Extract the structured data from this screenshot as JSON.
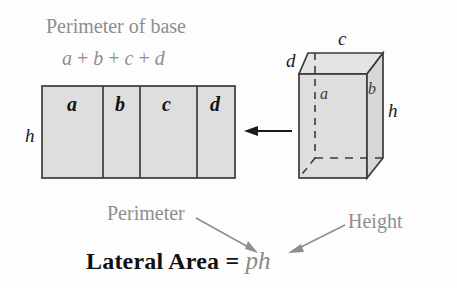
{
  "figure": {
    "title_annotation": "Perimeter of base",
    "base_sum_expression": {
      "terms": [
        "a",
        "b",
        "c",
        "d"
      ],
      "plus": "+",
      "full": "a + b + c + d"
    },
    "net_rectangle": {
      "panel_labels": [
        "a",
        "b",
        "c",
        "d"
      ],
      "height_label": "h",
      "fill_color": "#dedede",
      "stroke_color": "#3b3b3b"
    },
    "prism": {
      "top_edge_label": "c",
      "back_left_edge_label": "d",
      "hidden_vertical_edge_label": "a",
      "right_face_label": "b",
      "height_label": "h",
      "fill_color": "#dedede",
      "stroke_color": "#3b3b3b",
      "hidden_edge_style": "dashed"
    },
    "unfold_arrow": {
      "direction": "left",
      "name": "unfold-arrow"
    },
    "callouts": [
      {
        "label": "Perimeter",
        "points_to": "p"
      },
      {
        "label": "Height",
        "points_to": "h"
      }
    ],
    "formula": {
      "lead": "Lateral Area =",
      "symbols": "ph",
      "full": "Lateral Area = ph"
    },
    "colors": {
      "annotation_gray": "#8e8e8e",
      "ink_black": "#131313",
      "shape_fill": "#dedede",
      "shape_stroke": "#3b3b3b",
      "background": "#fdfdfd"
    }
  }
}
